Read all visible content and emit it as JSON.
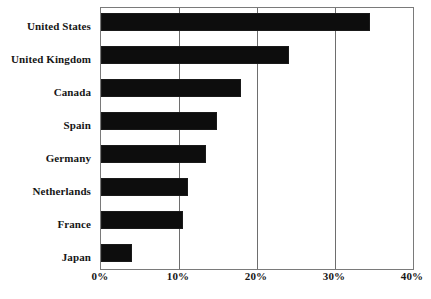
{
  "chart_data": {
    "type": "bar",
    "orientation": "horizontal",
    "title": "",
    "subtitle": "",
    "xlabel": "",
    "ylabel": "",
    "categories": [
      "United States",
      "United Kingdom",
      "Canada",
      "Spain",
      "Germany",
      "Netherlands",
      "France",
      "Japan"
    ],
    "values": [
      34.5,
      24.1,
      18.0,
      14.9,
      13.4,
      11.2,
      10.5,
      4.0
    ],
    "value_unit": "%",
    "xlim": [
      0,
      40
    ],
    "ylim": null,
    "xticks": [
      0,
      10,
      20,
      30,
      40
    ],
    "xtick_labels": [
      "0%",
      "10%",
      "20%",
      "30%",
      "40%"
    ],
    "grid": "vertical",
    "legend": null,
    "legend_position": "none",
    "bar_color": "#0d0d0d",
    "plot_border_color": "#7a7a7a",
    "gridline_color": "#6e6e6e",
    "text_color": "#161616"
  }
}
